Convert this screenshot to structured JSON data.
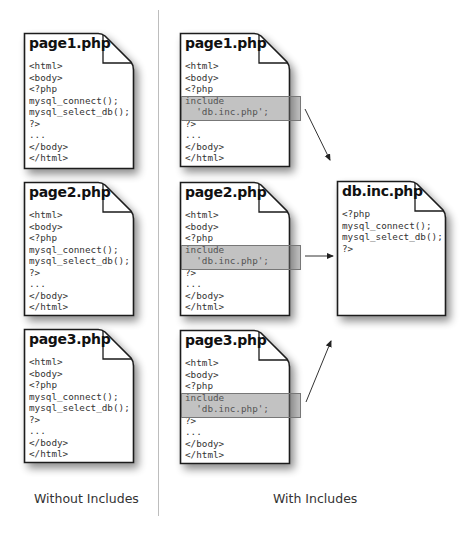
{
  "left_panel": {
    "caption": "Without Includes",
    "docs": [
      {
        "title": "page1.php",
        "code": "<html>\n<body>\n<?php\nmysql_connect();\nmysql_select_db();\n?>\n...\n</body>\n</html>"
      },
      {
        "title": "page2.php",
        "code": "<html>\n<body>\n<?php\nmysql_connect();\nmysql_select_db();\n?>\n...\n</body>\n</html>"
      },
      {
        "title": "page3.php",
        "code": "<html>\n<body>\n<?php\nmysql_connect();\nmysql_select_db();\n?>\n...\n</body>\n</html>"
      }
    ]
  },
  "right_panel": {
    "caption": "With Includes",
    "docs": [
      {
        "title": "page1.php",
        "code": "<html>\n<body>\n<?php\ninclude\n  'db.inc.php';\n?>\n...\n</body>\n</html>"
      },
      {
        "title": "page2.php",
        "code": "<html>\n<body>\n<?php\ninclude\n  'db.inc.php';\n?>\n...\n</body>\n</html>"
      },
      {
        "title": "page3.php",
        "code": "<html>\n<body>\n<?php\ninclude\n  'db.inc.php';\n?>\n...\n</body>\n</html>"
      }
    ],
    "included_file": {
      "title": "db.inc.php",
      "code": "<?php\nmysql_connect();\nmysql_select_db();\n?>"
    }
  },
  "colors": {
    "border": "#1a1a1a",
    "highlight": "#8a8a8a",
    "divider": "#bdbdbd"
  }
}
